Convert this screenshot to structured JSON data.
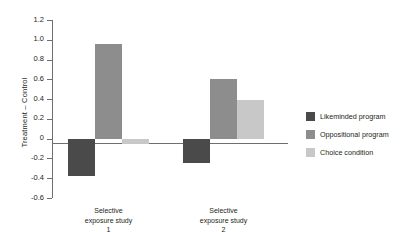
{
  "chart_data": {
    "type": "bar",
    "title": "",
    "xlabel": "",
    "ylabel": "Treatment – Control",
    "ylim": [
      -0.6,
      1.2
    ],
    "yticks": [
      1.2,
      1.0,
      0.8,
      0.6,
      0.4,
      0.2,
      0,
      -0.2,
      -0.4,
      -0.6
    ],
    "ytick_labels": [
      "1.2",
      "1.0",
      "0.8",
      "0.6",
      "0.4",
      "0.2",
      "0",
      "-0.2",
      "-0.4",
      "-0.6"
    ],
    "grid": false,
    "legend_position": "right",
    "categories": [
      "Selective\nexposure study\n1",
      "Selective\nexposure study\n2"
    ],
    "category_lines": [
      [
        "Selective",
        "exposure study",
        "1"
      ],
      [
        "Selective",
        "exposure study",
        "2"
      ]
    ],
    "series": [
      {
        "name": "Likeminded program",
        "color": "#4a4a4a",
        "values": [
          -0.38,
          -0.25
        ]
      },
      {
        "name": "Oppositional program",
        "color": "#8d8d8d",
        "values": [
          0.96,
          0.6
        ]
      },
      {
        "name": "Choice condition",
        "color": "#c8c8c8",
        "values": [
          -0.05,
          0.39
        ]
      }
    ]
  },
  "colors": {
    "axis": "#6f6f6f",
    "text": "#231f20",
    "background": "#ffffff"
  }
}
